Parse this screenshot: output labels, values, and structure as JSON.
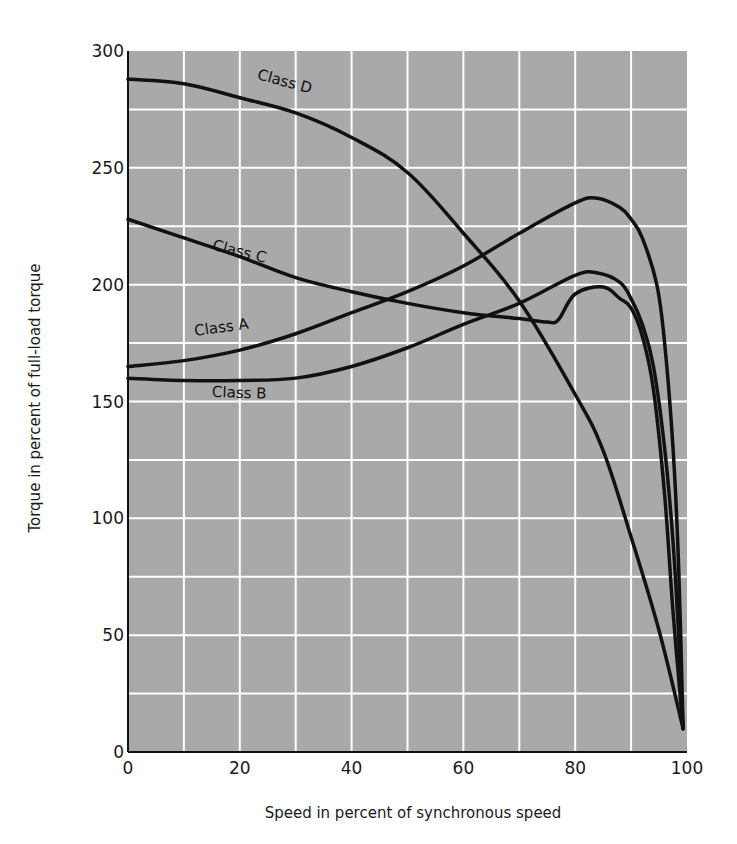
{
  "chart_data": {
    "type": "line",
    "title": "",
    "xlabel": "Speed in percent of synchronous speed",
    "ylabel": "Torque in percent of full-load torque",
    "xlim": [
      0,
      100
    ],
    "ylim": [
      0,
      300
    ],
    "x_ticks": [
      0,
      20,
      40,
      60,
      80,
      100
    ],
    "y_ticks": [
      0,
      50,
      100,
      150,
      200,
      250,
      300
    ],
    "grid": {
      "on": true,
      "x_step": 10,
      "y_step": 25,
      "color": "#ffffff"
    },
    "plot_background": "#a9a9a9",
    "line_color": "#111111",
    "legend": "inline labels on curves",
    "series": [
      {
        "name": "Class A",
        "label_pos": {
          "x": 12,
          "y": 178,
          "rotate": -8
        },
        "x": [
          0,
          10,
          20,
          30,
          40,
          50,
          60,
          70,
          80,
          84,
          88,
          90,
          92,
          94.6,
          96,
          97.5,
          98.5,
          99.3
        ],
        "values": [
          165,
          167.5,
          172,
          179,
          188,
          197,
          208,
          222,
          235,
          237,
          233,
          228,
          220,
          200,
          175,
          130,
          80,
          10
        ]
      },
      {
        "name": "Class B",
        "label_pos": {
          "x": 15,
          "y": 152,
          "rotate": 2
        },
        "x": [
          0,
          10,
          20,
          30,
          40,
          50,
          60,
          70,
          80,
          84,
          88,
          90,
          92,
          94,
          96,
          97.5,
          98.5,
          99.3
        ],
        "values": [
          160,
          159,
          159,
          160,
          165,
          173,
          183,
          192,
          204,
          205,
          201,
          194,
          183,
          165,
          130,
          90,
          50,
          10
        ]
      },
      {
        "name": "Class C",
        "label_pos": {
          "x": 15,
          "y": 215,
          "rotate": 14
        },
        "x": [
          0,
          10,
          20,
          30,
          40,
          50,
          60,
          70,
          75,
          77,
          80,
          85,
          88,
          90,
          92,
          94,
          96,
          97.5,
          99.3
        ],
        "values": [
          228,
          220,
          212,
          203,
          197,
          192,
          188,
          185.5,
          184,
          185,
          196,
          199,
          194,
          190,
          178,
          155,
          110,
          60,
          10
        ]
      },
      {
        "name": "Class D",
        "label_pos": {
          "x": 23,
          "y": 288,
          "rotate": 15
        },
        "x": [
          0,
          10,
          20,
          30,
          40,
          50,
          60,
          70,
          80,
          85,
          90,
          95,
          99.3
        ],
        "values": [
          288,
          286,
          280,
          273.5,
          263,
          248,
          222,
          193,
          153,
          129,
          92,
          52,
          10
        ]
      }
    ]
  }
}
